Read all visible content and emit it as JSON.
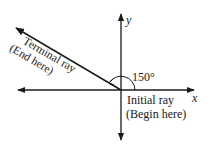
{
  "diagram": {
    "axes": {
      "x_label": "x",
      "y_label": "y"
    },
    "angle": {
      "value_label": "150°",
      "degrees": 150
    },
    "terminal_ray": {
      "line1": "Terminal ray",
      "line2": "(End here)"
    },
    "initial_ray": {
      "line1": "Initial ray",
      "line2": "(Begin here)"
    },
    "colors": {
      "stroke": "#1a1a1a",
      "background": "#ffffff"
    }
  }
}
